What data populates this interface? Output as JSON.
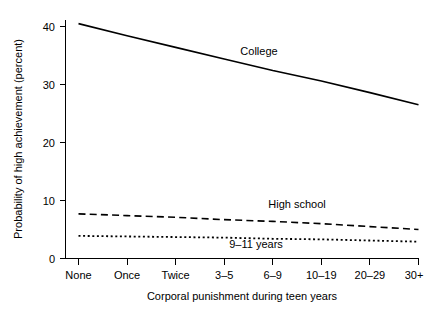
{
  "chart_data": {
    "type": "line",
    "title": "",
    "xlabel": "Corporal punishment during teen years",
    "ylabel": "Probability of high achievement (percent)",
    "categories": [
      "None",
      "Once",
      "Twice",
      "3–5",
      "6–9",
      "10–19",
      "20–29",
      "30+"
    ],
    "ylim": [
      0,
      42
    ],
    "yticks": [
      0,
      10,
      20,
      30,
      40
    ],
    "ytick_labels": [
      "0",
      "10",
      "20",
      "30",
      "40"
    ],
    "grid": false,
    "legend_position": "inline-annotations",
    "series": [
      {
        "name": "College",
        "style": "solid",
        "label_text": "College",
        "values": [
          40.5,
          38.4,
          36.4,
          34.4,
          32.4,
          30.6,
          28.6,
          26.5
        ]
      },
      {
        "name": "High school",
        "style": "dashed",
        "label_text": "High school",
        "values": [
          7.7,
          7.4,
          7.1,
          6.7,
          6.4,
          6.0,
          5.5,
          5.0
        ]
      },
      {
        "name": "9–11 years",
        "style": "dotted",
        "label_text": "9–11 years",
        "values": [
          3.9,
          3.8,
          3.7,
          3.6,
          3.4,
          3.3,
          3.1,
          2.9
        ]
      }
    ]
  },
  "annotations": {
    "college_label": "College",
    "high_school_label": "High school",
    "nine_eleven_label": "9–11 years"
  },
  "axes": {
    "y_title": "Probability of high achievement (percent)",
    "x_title": "Corporal punishment during teen years",
    "y_tick_0": "0",
    "y_tick_10": "10",
    "y_tick_20": "20",
    "y_tick_30": "30",
    "y_tick_40": "40",
    "x_cat_0": "None",
    "x_cat_1": "Once",
    "x_cat_2": "Twice",
    "x_cat_3": "3–5",
    "x_cat_4": "6–9",
    "x_cat_5": "10–19",
    "x_cat_6": "20–29",
    "x_cat_7": "30+"
  },
  "colors": {
    "ink": "#000000",
    "background": "#ffffff"
  }
}
